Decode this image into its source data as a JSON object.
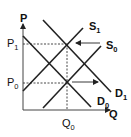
{
  "diagram": {
    "type": "supply-demand",
    "axes": {
      "y_label": "P",
      "x_label": "Q"
    },
    "price_levels": [
      {
        "name": "P",
        "sub": "1"
      },
      {
        "name": "P",
        "sub": "0"
      }
    ],
    "quantity_levels": [
      {
        "name": "Q",
        "sub": "0"
      }
    ],
    "curves": [
      {
        "id": "S1",
        "name": "S",
        "sub": "1",
        "kind": "supply"
      },
      {
        "id": "S0",
        "name": "S",
        "sub": "0",
        "kind": "supply"
      },
      {
        "id": "D1",
        "name": "D",
        "sub": "1",
        "kind": "demand"
      },
      {
        "id": "D0",
        "name": "D",
        "sub": "0",
        "kind": "demand"
      }
    ],
    "shifts": [
      {
        "from": "S0",
        "to": "S1",
        "direction": "left"
      },
      {
        "from": "D0",
        "to": "D1",
        "direction": "right"
      }
    ],
    "equilibria": [
      {
        "curves": [
          "S1",
          "D1"
        ],
        "price": "P1",
        "quantity": "Q0"
      },
      {
        "curves": [
          "S0",
          "D0"
        ],
        "price": "P0",
        "quantity": "Q0"
      }
    ]
  }
}
